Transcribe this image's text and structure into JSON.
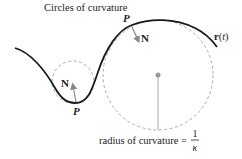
{
  "diagram": {
    "title": "Circles of curvature",
    "curve_label_r": "r",
    "curve_label_paren_open": "(",
    "curve_label_t": "t",
    "curve_label_paren_close": ")",
    "points": [
      {
        "label": "P",
        "normal_label": "N",
        "position": "top"
      },
      {
        "label": "P",
        "normal_label": "N",
        "position": "bottom"
      }
    ],
    "radius_caption": "radius of curvature =",
    "fraction_numerator": "1",
    "fraction_denominator": "κ",
    "colors": {
      "curve": "#1a1a1a",
      "circle": "#aaaaaa",
      "arrow": "#888888",
      "center_dot": "#999999",
      "text": "#222222"
    }
  }
}
